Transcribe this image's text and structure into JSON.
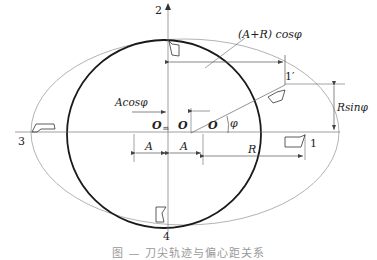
{
  "diagram": {
    "points": {
      "p1": "1",
      "p1_prime": "1′",
      "p2": "2",
      "p3": "3",
      "p4": "4"
    },
    "centers": {
      "o_m": "O",
      "o_m_sub": "m",
      "o": "O",
      "o_prime": "O"
    },
    "angle": "φ",
    "dimensions": {
      "a_plus_r_cos": "(A+R) cosφ",
      "a_cos": "Acosφ",
      "r_sin": "Rsinφ",
      "a_left": "A",
      "a_right": "A",
      "r": "R"
    },
    "colors": {
      "thick_circle": "#1a1a1a",
      "thin_ellipse": "#9a9a9a",
      "lines": "#555555"
    }
  },
  "caption": "图 — 刀尖轨迹与偏心距关系"
}
